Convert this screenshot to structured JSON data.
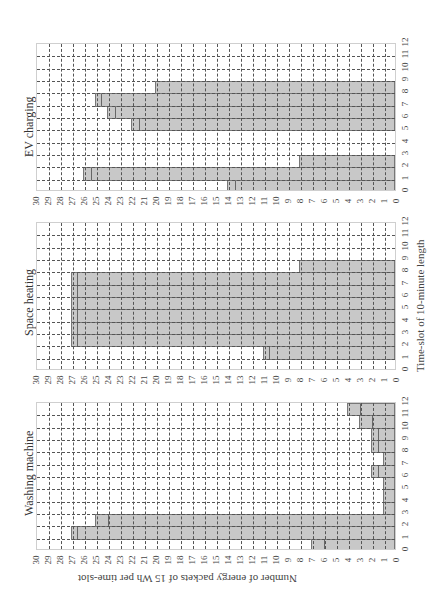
{
  "chart_data": [
    {
      "type": "bar",
      "orientation": "rotated-90-ccw",
      "title": "EV charging",
      "xlabel": "Time-slot of 10-minute length",
      "ylabel": "Number of energy packets of 15 Wh per time-slot",
      "categories": [
        0,
        1,
        2,
        3,
        4,
        5,
        6,
        7,
        8,
        9,
        10,
        11
      ],
      "x_ticks": [
        0,
        1,
        2,
        3,
        4,
        5,
        6,
        7,
        8,
        9,
        10,
        11,
        12
      ],
      "y_ticks": [
        0,
        1,
        2,
        3,
        4,
        5,
        6,
        7,
        8,
        9,
        10,
        11,
        12,
        13,
        14,
        15,
        16,
        17,
        18,
        19,
        20,
        21,
        22,
        23,
        24,
        25,
        26,
        27,
        28,
        29,
        30
      ],
      "ylim": [
        0,
        30
      ],
      "series": [
        {
          "name": "upper bound",
          "values": [
            14,
            26,
            8,
            0,
            0,
            22,
            24,
            25,
            20,
            0,
            0,
            0
          ]
        },
        {
          "name": "scheduled",
          "values": [
            13.4,
            25.4,
            8,
            0,
            0,
            21.4,
            23.4,
            24.6,
            20,
            0,
            0,
            0
          ]
        }
      ],
      "grid": true
    },
    {
      "type": "bar",
      "orientation": "rotated-90-ccw",
      "title": "Space heating",
      "xlabel": "Time-slot of 10-minute length",
      "ylabel": "Number of energy packets of 15 Wh per time-slot",
      "categories": [
        0,
        1,
        2,
        3,
        4,
        5,
        6,
        7,
        8,
        9,
        10,
        11
      ],
      "x_ticks": [
        0,
        1,
        2,
        3,
        4,
        5,
        6,
        7,
        8,
        9,
        10,
        11,
        12
      ],
      "y_ticks": [
        0,
        1,
        2,
        3,
        4,
        5,
        6,
        7,
        8,
        9,
        10,
        11,
        12,
        13,
        14,
        15,
        16,
        17,
        18,
        19,
        20,
        21,
        22,
        23,
        24,
        25,
        26,
        27,
        28,
        29,
        30
      ],
      "ylim": [
        0,
        30
      ],
      "series": [
        {
          "name": "upper bound",
          "values": [
            0,
            11,
            27,
            27,
            27,
            27,
            27,
            27,
            8,
            0,
            0,
            0
          ]
        },
        {
          "name": "scheduled",
          "values": [
            0,
            10.6,
            26.6,
            26.6,
            26.6,
            26.6,
            26.6,
            26.6,
            8,
            0,
            0,
            0
          ]
        }
      ],
      "grid": true
    },
    {
      "type": "bar",
      "orientation": "rotated-90-ccw",
      "title": "Washing machine",
      "xlabel": "Time-slot of 10-minute length",
      "ylabel": "Number of energy packets of 15 Wh per time-slot",
      "categories": [
        0,
        1,
        2,
        3,
        4,
        5,
        6,
        7,
        8,
        9,
        10,
        11
      ],
      "x_ticks": [
        0,
        1,
        2,
        3,
        4,
        5,
        6,
        7,
        8,
        9,
        10,
        11,
        12
      ],
      "y_ticks": [
        0,
        1,
        2,
        3,
        4,
        5,
        6,
        7,
        8,
        9,
        10,
        11,
        12,
        13,
        14,
        15,
        16,
        17,
        18,
        19,
        20,
        21,
        22,
        23,
        24,
        25,
        26,
        27,
        28,
        29,
        30
      ],
      "ylim": [
        0,
        30
      ],
      "series": [
        {
          "name": "upper bound",
          "values": [
            7,
            27,
            25,
            1,
            1,
            1,
            2,
            1,
            2,
            2,
            3,
            4
          ]
        },
        {
          "name": "scheduled",
          "values": [
            6,
            26.6,
            24,
            1,
            1,
            1,
            1.5,
            1,
            1.5,
            1.5,
            2,
            3
          ]
        }
      ],
      "grid": true
    }
  ],
  "panels": [
    {
      "title": "EV charging",
      "top": 43
    },
    {
      "title": "Space heating",
      "top": 222
    },
    {
      "title": "Washing machine",
      "top": 402
    }
  ],
  "axis": {
    "xlabel": "Time-slot of 10-minute length",
    "ylabel": "Number of energy packets of 15 Wh per time-slot"
  },
  "colors": {
    "bar_fill": "#c8c8c8",
    "bar_edge": "#777777",
    "grid": "#555555"
  }
}
